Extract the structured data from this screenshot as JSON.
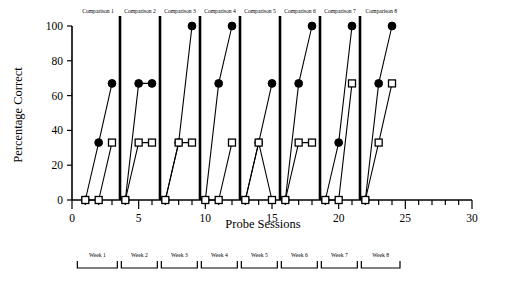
{
  "figure": {
    "background_color": "#ffffff",
    "ink_color": "#000000",
    "width": 526,
    "height": 290
  },
  "chart_data": {
    "type": "line",
    "title": "",
    "subtitle": "",
    "xlabel": "Probe Sessions",
    "ylabel": "Percentage Correct",
    "xlim": [
      0,
      30
    ],
    "ylim": [
      0,
      100
    ],
    "xticks_major": [
      0,
      5,
      10,
      15,
      20,
      25,
      30
    ],
    "xticks_major_labels": [
      "0",
      "5",
      "10",
      "15",
      "20",
      "25",
      "30"
    ],
    "xtick_minor_step": 1,
    "yticks": [
      0,
      20,
      40,
      60,
      80,
      100
    ],
    "ytick_labels": [
      "0",
      "20",
      "40",
      "60",
      "80",
      "100"
    ],
    "grid": false,
    "legend_position": "none",
    "series": [
      {
        "name": "filled-circle-series",
        "marker": "filled-circle",
        "points": [
          {
            "x": 1,
            "y": 0
          },
          {
            "x": 2,
            "y": 33
          },
          {
            "x": 3,
            "y": 67
          },
          {
            "x": 4,
            "y": 0
          },
          {
            "x": 5,
            "y": 67
          },
          {
            "x": 6,
            "y": 67
          },
          {
            "x": 7,
            "y": 0
          },
          {
            "x": 8,
            "y": 33
          },
          {
            "x": 9,
            "y": 100
          },
          {
            "x": 10,
            "y": 0
          },
          {
            "x": 11,
            "y": 67
          },
          {
            "x": 12,
            "y": 100
          },
          {
            "x": 13,
            "y": 0
          },
          {
            "x": 14,
            "y": 33
          },
          {
            "x": 15,
            "y": 67
          },
          {
            "x": 16,
            "y": 0
          },
          {
            "x": 17,
            "y": 67
          },
          {
            "x": 18,
            "y": 100
          },
          {
            "x": 19,
            "y": 0
          },
          {
            "x": 20,
            "y": 33
          },
          {
            "x": 21,
            "y": 100
          },
          {
            "x": 22,
            "y": 0
          },
          {
            "x": 23,
            "y": 67
          },
          {
            "x": 24,
            "y": 100
          }
        ]
      },
      {
        "name": "open-square-series",
        "marker": "open-square",
        "points": [
          {
            "x": 1,
            "y": 0
          },
          {
            "x": 2,
            "y": 0
          },
          {
            "x": 3,
            "y": 33
          },
          {
            "x": 4,
            "y": 0
          },
          {
            "x": 5,
            "y": 33
          },
          {
            "x": 6,
            "y": 33
          },
          {
            "x": 7,
            "y": 0
          },
          {
            "x": 8,
            "y": 33
          },
          {
            "x": 9,
            "y": 33
          },
          {
            "x": 10,
            "y": 0
          },
          {
            "x": 11,
            "y": 0
          },
          {
            "x": 12,
            "y": 33
          },
          {
            "x": 13,
            "y": 0
          },
          {
            "x": 14,
            "y": 33
          },
          {
            "x": 15,
            "y": 0
          },
          {
            "x": 16,
            "y": 0
          },
          {
            "x": 17,
            "y": 33
          },
          {
            "x": 18,
            "y": 33
          },
          {
            "x": 19,
            "y": 0
          },
          {
            "x": 20,
            "y": 0
          },
          {
            "x": 21,
            "y": 67
          },
          {
            "x": 22,
            "y": 0
          },
          {
            "x": 23,
            "y": 33
          },
          {
            "x": 24,
            "y": 67
          }
        ]
      }
    ],
    "panels": [
      {
        "label": "Comparison 1",
        "x_start": 0.3,
        "x_end": 3.6,
        "divider_x": 3.6
      },
      {
        "label": "Comparison 2",
        "x_start": 3.6,
        "x_end": 6.6,
        "divider_x": 6.6
      },
      {
        "label": "Comparison 3",
        "x_start": 6.6,
        "x_end": 9.6,
        "divider_x": 9.6
      },
      {
        "label": "Comparison 4",
        "x_start": 9.6,
        "x_end": 12.6,
        "divider_x": 12.6
      },
      {
        "label": "Comparison 5",
        "x_start": 12.6,
        "x_end": 15.6,
        "divider_x": 15.6
      },
      {
        "label": "Comparison 6",
        "x_start": 15.6,
        "x_end": 18.6,
        "divider_x": 18.6
      },
      {
        "label": "Comparison 7",
        "x_start": 18.6,
        "x_end": 21.6,
        "divider_x": 21.6
      },
      {
        "label": "Comparison 8",
        "x_start": 21.6,
        "x_end": 24.8,
        "divider_x": null
      }
    ],
    "week_brackets": [
      {
        "label": "Week 1",
        "x_start": 0.4,
        "x_end": 3.4
      },
      {
        "label": "Week 2",
        "x_start": 3.7,
        "x_end": 6.4
      },
      {
        "label": "Week 3",
        "x_start": 6.7,
        "x_end": 9.4
      },
      {
        "label": "Week 4",
        "x_start": 9.7,
        "x_end": 12.4
      },
      {
        "label": "Week 5",
        "x_start": 12.7,
        "x_end": 15.4
      },
      {
        "label": "Week 6",
        "x_start": 15.7,
        "x_end": 18.4
      },
      {
        "label": "Week 7",
        "x_start": 18.7,
        "x_end": 21.4
      },
      {
        "label": "Week 8",
        "x_start": 21.7,
        "x_end": 24.6
      }
    ]
  }
}
